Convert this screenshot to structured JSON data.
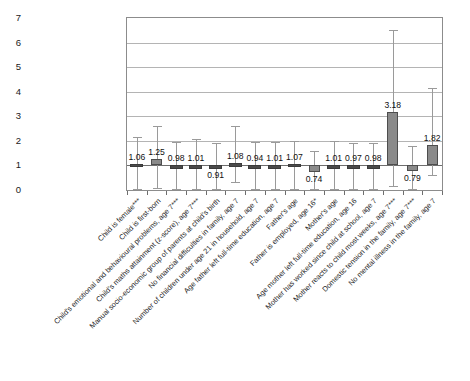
{
  "chart_data": {
    "type": "bar",
    "title": "",
    "subtitle": "",
    "xlabel": "",
    "ylabel": "",
    "ylim": [
      0,
      7
    ],
    "yticks": [
      0,
      1,
      2,
      3,
      4,
      5,
      6,
      7
    ],
    "grid": true,
    "legend": false,
    "reference_line": 1,
    "categories": [
      "Child is female***",
      "Child is first-born",
      "Child's emotional and behavioural problems, age 7***",
      "Child's maths attainment (z-score), age 7***",
      "Manual socio-economic group of parents at child's birth",
      "No financial difficulties in family, age 7",
      "Number of children under age 21 in household, age 7",
      "Age father left full-time education, age 7",
      "Father's age",
      "Father is employed, age 16*",
      "Mother's age",
      "Age mother left full-time education, age 16",
      "Mother has worked since child at school, age 7",
      "Mother reacts to child most weeks, age 7***",
      "Domestic tension in the family, age 7***",
      "No mental illness in the family, age 7"
    ],
    "values": [
      1.06,
      1.25,
      0.98,
      1.01,
      0.91,
      1.08,
      0.94,
      1.01,
      1.07,
      0.74,
      1.01,
      0.97,
      0.98,
      3.18,
      0.79,
      1.82
    ],
    "value_labels": [
      "1.06",
      "1.25",
      "0.98",
      "1.01",
      "0.91",
      "1.08",
      "0.94",
      "1.01",
      "1.07",
      "0.74",
      "1.01",
      "0.97",
      "0.98",
      "3.18",
      "0.79",
      "1.82"
    ],
    "ci_low": [
      0.05,
      0.1,
      0.03,
      0.03,
      0.05,
      0.33,
      0.04,
      0.04,
      0.04,
      0.05,
      0.03,
      0.03,
      0.03,
      0.15,
      0.04,
      0.6
    ],
    "ci_high": [
      2.16,
      2.62,
      1.97,
      2.08,
      1.93,
      2.62,
      1.95,
      1.97,
      1.98,
      1.58,
      1.98,
      1.93,
      1.92,
      6.5,
      1.78,
      4.15
    ],
    "label_positions": [
      "above",
      "above",
      "above",
      "above",
      "below",
      "above",
      "above",
      "above",
      "above",
      "below",
      "above",
      "above",
      "above",
      "above",
      "below",
      "above"
    ]
  }
}
